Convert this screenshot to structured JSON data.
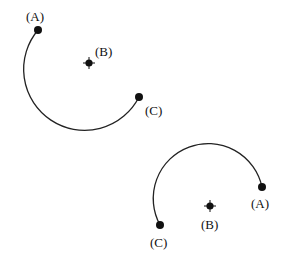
{
  "diagrams": [
    {
      "name": "arc-top",
      "points": {
        "A": {
          "label": "(A)",
          "x": 38,
          "y": 30,
          "label_x": 26,
          "label_y": 21
        },
        "B": {
          "label": "(B)",
          "x": 89,
          "y": 63,
          "label_x": 95,
          "label_y": 56
        },
        "C": {
          "label": "(C)",
          "x": 139,
          "y": 97,
          "label_x": 145,
          "label_y": 115
        }
      },
      "arc_path": "M38,30 A61,61 0 1,0 139,97"
    },
    {
      "name": "arc-bottom",
      "points": {
        "A": {
          "label": "(A)",
          "x": 262,
          "y": 187,
          "label_x": 251,
          "label_y": 208
        },
        "B": {
          "label": "(B)",
          "x": 210,
          "y": 206,
          "label_x": 201,
          "label_y": 229
        },
        "C": {
          "label": "(C)",
          "x": 160,
          "y": 225,
          "label_x": 150,
          "label_y": 247
        }
      },
      "arc_path": "M262,187 A55,55 0 1,0 160,225"
    }
  ],
  "colors": {
    "ink": "#111111",
    "background": "#ffffff"
  }
}
